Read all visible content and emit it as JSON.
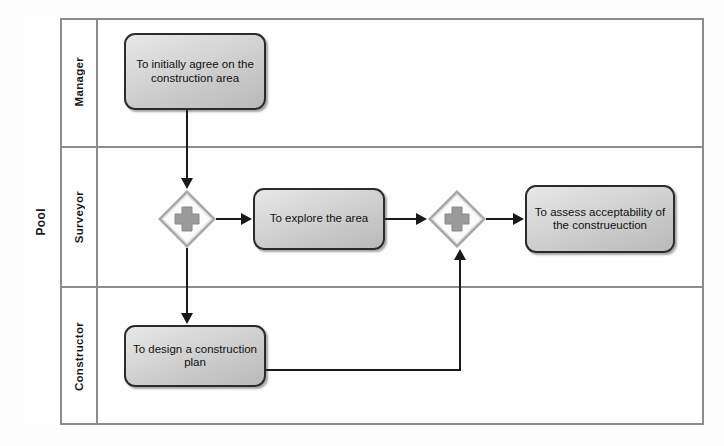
{
  "diagram": {
    "type": "bpmn-collaboration",
    "pool": {
      "label": "Pool"
    },
    "lanes": [
      {
        "id": "manager",
        "label": "Manager"
      },
      {
        "id": "surveyor",
        "label": "Surveyor"
      },
      {
        "id": "constructor",
        "label": "Constructor"
      }
    ],
    "tasks": [
      {
        "id": "task-agree",
        "lane": "manager",
        "label": "To initially agree on the construction area"
      },
      {
        "id": "task-explore",
        "lane": "surveyor",
        "label": "To explore the area"
      },
      {
        "id": "task-assess",
        "lane": "surveyor",
        "label": "To assess acceptability of the construeuction"
      },
      {
        "id": "task-design",
        "lane": "constructor",
        "label": "To design a construction plan"
      }
    ],
    "gateways": [
      {
        "id": "gw1",
        "lane": "surveyor",
        "kind": "parallel",
        "icon": "plus-icon",
        "label": ""
      },
      {
        "id": "gw2",
        "lane": "surveyor",
        "kind": "parallel",
        "icon": "plus-icon",
        "label": ""
      }
    ],
    "flows": [
      {
        "id": "flow-agree-gw1",
        "from": "task-agree",
        "to": "gw1",
        "label": ""
      },
      {
        "id": "flow-gw1-explore",
        "from": "gw1",
        "to": "task-explore",
        "label": ""
      },
      {
        "id": "flow-gw1-design",
        "from": "gw1",
        "to": "task-design",
        "label": ""
      },
      {
        "id": "flow-explore-gw2",
        "from": "task-explore",
        "to": "gw2",
        "label": ""
      },
      {
        "id": "flow-design-gw2",
        "from": "task-design",
        "to": "gw2",
        "label": ""
      },
      {
        "id": "flow-gw2-assess",
        "from": "gw2",
        "to": "task-assess",
        "label": ""
      }
    ],
    "colors": {
      "pool_border": "#8c8c8c",
      "task_border": "#2b2b2b",
      "task_fill_light": "#e8e8e8",
      "task_fill_dark": "#b9b9b9",
      "gateway_fill": "#fbfbfb",
      "gateway_border": "#a8a8a8",
      "gateway_symbol": "#9a9a9a",
      "connector": "#1a1a1a",
      "canvas_bg": "#fdfdfd"
    }
  }
}
